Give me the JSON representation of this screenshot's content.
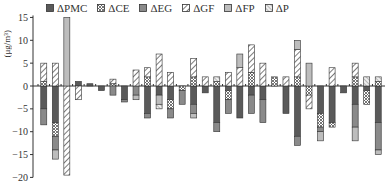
{
  "chart_data": {
    "type": "bar",
    "stacked": true,
    "title": "",
    "xlabel": "",
    "ylabel": "(μg/m³)",
    "ylim": [
      -20,
      15
    ],
    "yticks": [
      15,
      10,
      5,
      0,
      -5,
      -10,
      -15,
      -20
    ],
    "legend_position": "top",
    "grid": false,
    "series": [
      {
        "name": "ΔPMC",
        "pattern": "solid-dark",
        "color": "#5a5a5a",
        "values": [
          -5,
          -8,
          0,
          1,
          0.5,
          -1,
          0,
          -3,
          0,
          -6,
          -2,
          -3,
          0,
          -4,
          -1.5,
          -8,
          -1,
          -7,
          -2,
          -3,
          0,
          -6,
          -11,
          0,
          -6,
          -8,
          -1.5,
          -4,
          -1,
          -8
        ]
      },
      {
        "name": "ΔCE",
        "pattern": "crosshatch",
        "color": "#9a9a9a",
        "values": [
          1,
          -3,
          0,
          0,
          0,
          0,
          0.5,
          0,
          0,
          2,
          0,
          -2,
          -1,
          2,
          0,
          1,
          -2,
          0,
          3,
          0,
          2,
          0,
          2,
          -2,
          -3,
          -1,
          0,
          2,
          -3,
          1
        ]
      },
      {
        "name": "ΔEG",
        "pattern": "solid-mid",
        "color": "#8a8a8a",
        "values": [
          -3.5,
          -3,
          0,
          0,
          0,
          0,
          -2,
          -0.5,
          -2,
          -1,
          0,
          -2,
          -3,
          -2,
          0,
          -2,
          -3,
          0,
          -4,
          -5,
          0,
          0,
          -2,
          0,
          -1,
          0,
          0,
          -5,
          0,
          -6
        ]
      },
      {
        "name": "ΔGF",
        "pattern": "hatch-diag",
        "color": "#ffffff",
        "values": [
          4,
          5,
          -19.5,
          -3,
          0,
          0,
          1,
          0,
          3.5,
          2,
          7,
          3,
          0,
          4,
          2,
          0,
          3,
          4,
          6,
          5,
          0,
          2,
          6,
          -3,
          0,
          4,
          0,
          3,
          0,
          0
        ]
      },
      {
        "name": "ΔFP",
        "pattern": "solid-light",
        "color": "#bdbdbd",
        "values": [
          0,
          -2,
          15,
          0,
          0,
          0,
          0,
          0,
          -1,
          0,
          -2,
          0,
          0,
          -1,
          0,
          0,
          0,
          3,
          0,
          0,
          0,
          0,
          2,
          5,
          -2,
          0,
          0,
          -3,
          0,
          -1
        ]
      },
      {
        "name": "ΔP",
        "pattern": "hatch-dense",
        "color": "#dcdcdc",
        "values": [
          0,
          0,
          0,
          0,
          0,
          0,
          0,
          0,
          0,
          0,
          -1,
          0,
          0,
          0,
          0,
          1,
          0,
          0,
          0,
          0,
          0,
          0,
          0,
          0,
          0,
          0,
          0,
          0,
          2,
          1
        ]
      }
    ],
    "categories": [
      "1",
      "2",
      "3",
      "4",
      "5",
      "6",
      "7",
      "8",
      "9",
      "10",
      "11",
      "12",
      "13",
      "14",
      "15",
      "16",
      "17",
      "18",
      "19",
      "20",
      "21",
      "22",
      "23",
      "24",
      "25",
      "26",
      "27",
      "28",
      "29",
      "30"
    ]
  },
  "axis": {
    "y_label": "(μg/m³)"
  }
}
